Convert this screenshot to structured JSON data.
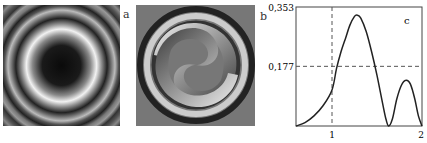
{
  "panels": {
    "a": {
      "label": "a",
      "description": "concentric ring intensity pattern with dark center"
    },
    "b": {
      "label": "b",
      "description": "two-armed spiral phase pattern"
    },
    "c": {
      "label": "c"
    }
  },
  "chart_data": {
    "type": "line",
    "title": "",
    "panel_label": "c",
    "xlabel": "",
    "ylabel": "",
    "x_ticks": [
      "1",
      "2"
    ],
    "y_ticks": [
      "0,177",
      "0,353"
    ],
    "xlim": [
      0.6,
      2.0
    ],
    "ylim": [
      0,
      0.353
    ],
    "reference_lines": {
      "vertical_x": 1,
      "horizontal_y": 0.177,
      "style": "dashed"
    },
    "grid": false,
    "series": [
      {
        "name": "curve",
        "x": [
          0.6,
          0.7,
          0.8,
          0.9,
          1.0,
          1.05,
          1.1,
          1.15,
          1.2,
          1.25,
          1.28,
          1.32,
          1.38,
          1.44,
          1.5,
          1.56,
          1.6,
          1.63,
          1.67,
          1.72,
          1.77,
          1.82,
          1.87,
          1.92,
          1.96,
          2.0
        ],
        "y": [
          0.0,
          0.01,
          0.03,
          0.06,
          0.107,
          0.17,
          0.22,
          0.26,
          0.3,
          0.325,
          0.329,
          0.32,
          0.28,
          0.22,
          0.15,
          0.07,
          0.02,
          0.0,
          0.02,
          0.08,
          0.12,
          0.136,
          0.125,
          0.08,
          0.03,
          0.0
        ]
      }
    ]
  }
}
